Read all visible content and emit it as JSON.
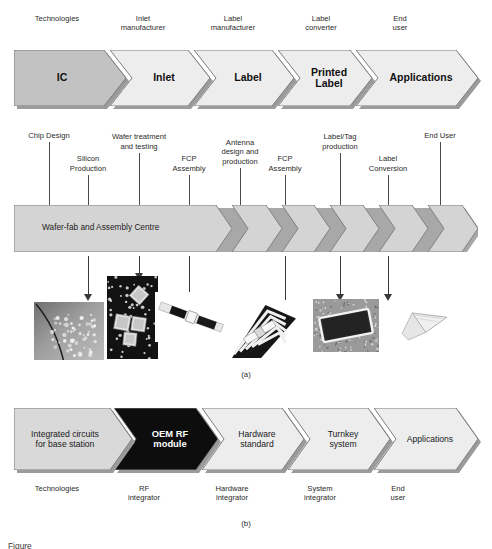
{
  "figure": {
    "caption_a": "(a)",
    "caption_b": "(b)",
    "figure_note": "Figure"
  },
  "part_a": {
    "top_roles": [
      {
        "text": "Technologies",
        "x": 14,
        "w": 86
      },
      {
        "text": "Inlet\nmanufacturer",
        "x": 100,
        "w": 86
      },
      {
        "text": "Label\nmanufacturer",
        "x": 190,
        "w": 86
      },
      {
        "text": "Label\nconverter",
        "x": 278,
        "w": 86
      },
      {
        "text": "End\nuser",
        "x": 370,
        "w": 60
      }
    ],
    "stages": [
      {
        "label": "IC",
        "x": 0,
        "w": 112,
        "fill": "#c2c2c2",
        "notched": false
      },
      {
        "label": "Inlet",
        "x": 96,
        "w": 100,
        "fill": "#ededed",
        "notched": true
      },
      {
        "label": "Label",
        "x": 180,
        "w": 100,
        "fill": "#ededed",
        "notched": true
      },
      {
        "label": "Printed\nLabel",
        "x": 264,
        "w": 94,
        "fill": "#ededed",
        "notched": true
      },
      {
        "label": "Applications",
        "x": 342,
        "w": 122,
        "fill": "#ededed",
        "notched": true
      }
    ],
    "process_labels": [
      {
        "text": "Chip Design",
        "cx": 49,
        "lx": 49,
        "ly_top": 142,
        "ly_h": 63
      },
      {
        "text": "Silicon\nProduction",
        "cx": 88,
        "lx": 88,
        "ly_top": 175,
        "ly_h": 30
      },
      {
        "text": "Wafer treatment\nand testing",
        "cx": 139,
        "lx": 139,
        "ly_top": 153,
        "ly_h": 52
      },
      {
        "text": "FCP\nAssembly",
        "cx": 189,
        "lx": 189,
        "ly_top": 175,
        "ly_h": 30
      },
      {
        "text": "Antenna\ndesign and\nproduction",
        "cx": 240,
        "lx": 240,
        "ly_top": 168,
        "ly_h": 37
      },
      {
        "text": "FCP\nAssembly",
        "cx": 285,
        "lx": 285,
        "ly_top": 175,
        "ly_h": 30
      },
      {
        "text": "Label/Tag\nproduction",
        "cx": 340,
        "lx": 340,
        "ly_top": 153,
        "ly_h": 52
      },
      {
        "text": "Label\nConversion",
        "cx": 388,
        "lx": 388,
        "ly_top": 175,
        "ly_h": 30
      },
      {
        "text": "End User",
        "cx": 440,
        "lx": 440,
        "ly_top": 142,
        "ly_h": 63
      }
    ],
    "band_label": "Wafer-fab and Assembly Centre",
    "band_color": "#d4d4d4",
    "photo_arrows": [
      {
        "x": 88,
        "y": 256,
        "h": 38
      },
      {
        "x": 139,
        "y": 256,
        "h": 17
      },
      {
        "x": 189,
        "y": 256,
        "h": 38
      },
      {
        "x": 285,
        "y": 256,
        "h": 52
      },
      {
        "x": 340,
        "y": 256,
        "h": 38
      },
      {
        "x": 388,
        "y": 256,
        "h": 38
      }
    ],
    "photos": [
      {
        "name": "silicon-wafer-photo",
        "x": 34,
        "y": 302,
        "w": 70,
        "h": 58,
        "kind": "wafer"
      },
      {
        "name": "flip-chip-array-photo",
        "x": 107,
        "y": 276,
        "w": 51,
        "h": 83,
        "kind": "chips"
      },
      {
        "name": "inlet-strip-photo",
        "x": 155,
        "y": 292,
        "w": 72,
        "h": 50,
        "kind": "strip"
      },
      {
        "name": "antenna-label-photo",
        "x": 228,
        "y": 300,
        "w": 72,
        "h": 62,
        "kind": "antenna"
      },
      {
        "name": "printed-label-photo",
        "x": 313,
        "y": 299,
        "w": 66,
        "h": 53,
        "kind": "label"
      },
      {
        "name": "application-tag-photo",
        "x": 396,
        "y": 300,
        "w": 62,
        "h": 54,
        "kind": "tag"
      }
    ]
  },
  "part_b": {
    "stages": [
      {
        "label": "Integrated circuits\nfor base station",
        "x": 0,
        "w": 118,
        "fill": "#d9d9d9",
        "color": "#1a1a1a",
        "bold": false,
        "notched": false
      },
      {
        "label": "OEM RF\nmodule",
        "x": 100,
        "w": 104,
        "fill": "#0d0d0d",
        "color": "#ffffff",
        "bold": true,
        "notched": true
      },
      {
        "label": "Hardware\nstandard",
        "x": 188,
        "w": 102,
        "fill": "#ededed",
        "color": "#1a1a1a",
        "bold": false,
        "notched": true
      },
      {
        "label": "Turnkey\nsystem",
        "x": 274,
        "w": 102,
        "fill": "#ededed",
        "color": "#1a1a1a",
        "bold": false,
        "notched": true
      },
      {
        "label": "Applications",
        "x": 360,
        "w": 104,
        "fill": "#ededed",
        "color": "#1a1a1a",
        "bold": false,
        "notched": true
      }
    ],
    "roles": [
      {
        "text": "Technologies",
        "x": 14,
        "w": 86
      },
      {
        "text": "RF\nintegrator",
        "x": 104,
        "w": 80
      },
      {
        "text": "Hardware\nintegrator",
        "x": 190,
        "w": 84
      },
      {
        "text": "System\nintegrator",
        "x": 278,
        "w": 84
      },
      {
        "text": "End\nuser",
        "x": 368,
        "w": 60
      }
    ]
  }
}
